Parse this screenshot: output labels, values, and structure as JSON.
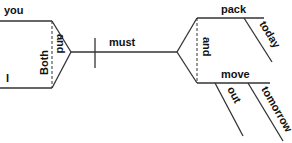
{
  "diagram": {
    "type": "sentence-diagram",
    "subject": {
      "words": [
        "you",
        "I"
      ],
      "correlative": "Both",
      "conjunction": "and"
    },
    "verb_phrase": {
      "auxiliary": "must",
      "verbs": [
        {
          "word": "pack",
          "modifiers": [
            "today"
          ]
        },
        {
          "word": "move",
          "modifiers": [
            "out",
            "tomorrow"
          ]
        }
      ],
      "conjunction": "and"
    }
  }
}
